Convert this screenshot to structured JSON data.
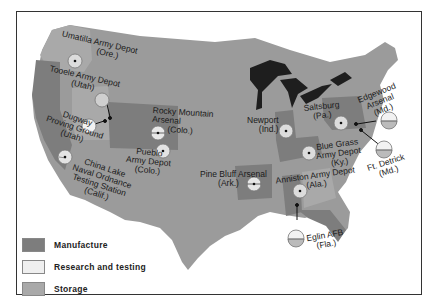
{
  "map": {
    "title": "",
    "colors": {
      "manufacture": "#7d7d7d",
      "research_testing": "#efefef",
      "storage": "#a9a9a9",
      "land": "#9b9b9b",
      "water": "#1e1e1e"
    },
    "legend": [
      {
        "key": "manufacture",
        "label": "Manufacture"
      },
      {
        "key": "research_testing",
        "label": "Research and testing"
      },
      {
        "key": "storage",
        "label": "Storage"
      }
    ],
    "sites": [
      {
        "name": "Umatilla Army Depot",
        "state": "(Ore.)",
        "type": "storage"
      },
      {
        "name": "Tooele Army Depot",
        "state": "(Utah)",
        "type": "storage"
      },
      {
        "name": "Dugway Proving Ground",
        "state": "(Utah)",
        "type": "research_testing"
      },
      {
        "name": "China Lake Naval Ordnance Testing Station",
        "state": "(Calif.)",
        "type": "storage"
      },
      {
        "name": "Rocky Mountain Arsenal",
        "state": "(Colo.)",
        "type": "manufacture"
      },
      {
        "name": "Pueblo Army Depot",
        "state": "(Colo.)",
        "type": "storage"
      },
      {
        "name": "Pine Bluff Arsenal",
        "state": "(Ark.)",
        "type": "manufacture"
      },
      {
        "name": "Newport",
        "state": "(Ind.)",
        "type": "manufacture"
      },
      {
        "name": "Saltsburg",
        "state": "(Pa.)",
        "type": "manufacture"
      },
      {
        "name": "Blue Grass Army Depot",
        "state": "(Ky.)",
        "type": "storage"
      },
      {
        "name": "Anniston Army Depot",
        "state": "(Ala.)",
        "type": "storage"
      },
      {
        "name": "Edgewood Arsenal",
        "state": "(Md.)",
        "type": "research_testing"
      },
      {
        "name": "Ft. Detrick",
        "state": "(Md.)",
        "type": "research_testing"
      },
      {
        "name": "Eglin AFB",
        "state": "(Fla.)",
        "type": "research_testing"
      }
    ],
    "labels": {
      "umatilla": [
        "Umatilla Army Depot",
        "(Ore.)"
      ],
      "tooele": [
        "Tooele Army Depot",
        "(Utah)"
      ],
      "dugway": [
        "Dugway",
        "Proving Ground",
        "(Utah)"
      ],
      "chinalake": [
        "China Lake",
        "Naval Ordnance",
        "Testing Station",
        "(Calif.)"
      ],
      "rocky": [
        "Rocky Mountain",
        "Arsenal",
        "(Colo.)"
      ],
      "pueblo": [
        "Pueblo",
        "Army Depot",
        "(Colo.)"
      ],
      "pinebluff": [
        "Pine Bluff Arsenal",
        "(Ark.)"
      ],
      "newport": [
        "Newport",
        "(Ind.)"
      ],
      "saltsburg": [
        "Saltsburg",
        "(Pa.)"
      ],
      "bluegrass": [
        "Blue Grass",
        "Army Depot",
        "(Ky.)"
      ],
      "anniston": [
        "Anniston Army Depot",
        "(Ala.)"
      ],
      "edgewood": [
        "Edgewood",
        "Arsenal",
        "(Md.)"
      ],
      "detrick": [
        "Ft. Detrick",
        "(Md.)"
      ],
      "eglin": [
        "Eglin AFB",
        "(Fla.)"
      ]
    }
  }
}
